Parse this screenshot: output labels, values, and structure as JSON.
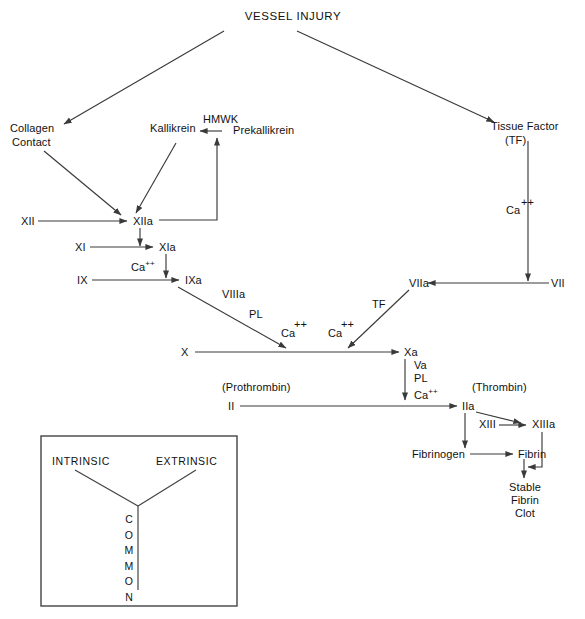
{
  "diagram": {
    "title": "VESSEL INJURY",
    "type": "coagulation-cascade",
    "nodes": {
      "vessel_injury": "VESSEL INJURY",
      "collagen": "Collagen",
      "contact": "Contact",
      "kallikrein": "Kallikrein",
      "hmwk": "HMWK",
      "prekallikrein": "Prekallikrein",
      "tissue_factor": "Tissue Factor",
      "tissue_factor_abbr": "(TF)",
      "xii": "XII",
      "xiia": "XIIa",
      "xi": "XI",
      "xia": "XIa",
      "ix": "IX",
      "ixa": "IXa",
      "x": "X",
      "xa": "Xa",
      "vii": "VII",
      "viia": "VIIa",
      "ii": "II",
      "iia": "IIa",
      "prothrombin": "(Prothrombin)",
      "thrombin": "(Thrombin)",
      "xiii": "XIII",
      "xiiia": "XIIIa",
      "fibrinogen": "Fibrinogen",
      "fibrin": "Fibrin",
      "stable": "Stable",
      "stable_fibrin": "Fibrin",
      "stable_clot": "Clot"
    },
    "cofactors": {
      "ca_tf_path": "Ca",
      "ca_tf_charge": "++",
      "ca_xia": "Ca",
      "ca_xia_charge": "++",
      "viiia": "VIIIa",
      "pl_intrinsic": "PL",
      "ca_intrinsic": "Ca",
      "ca_intrinsic_charge": "++",
      "tf_extrinsic": "TF",
      "ca_extrinsic": "Ca",
      "ca_extrinsic_charge": "++",
      "va": "Va",
      "pl_common": "PL",
      "ca_common": "Ca",
      "ca_common_charge": "++"
    },
    "legend": {
      "intrinsic": "INTRINSIC",
      "extrinsic": "EXTRINSIC",
      "common_letters": [
        "C",
        "O",
        "M",
        "M",
        "O",
        "N"
      ]
    },
    "colors": {
      "line": "#3a3a3a",
      "text": "#111111",
      "background": "#ffffff",
      "legend_border": "#444444"
    }
  }
}
